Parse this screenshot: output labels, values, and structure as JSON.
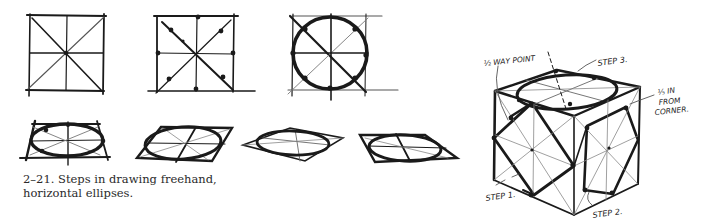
{
  "figure": {
    "caption_line1": "2–21. Steps in drawing freehand,",
    "caption_line2": "horizontal ellipses.",
    "ink_color": "#1a1a1a",
    "guide_color": "#8a8a8a",
    "background": "#ffffff"
  },
  "annotations": {
    "half_way_point": "½ WAY POINT",
    "step1": "STEP 1.",
    "step2": "STEP 2.",
    "step3": "STEP 3.",
    "fifth_in": "⅕ IN",
    "from": "FROM",
    "corner": "CORNER."
  }
}
